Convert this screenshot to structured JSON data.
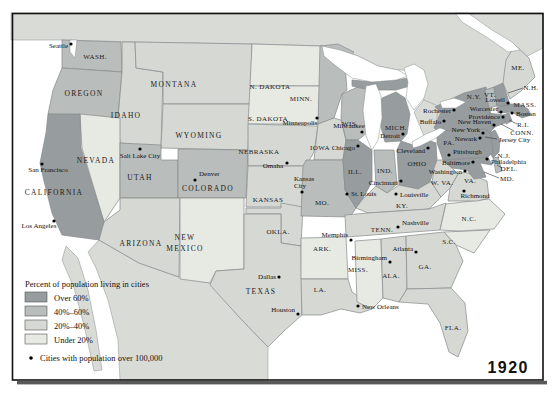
{
  "year_label": "1920",
  "legend": {
    "title": "Percent of population living in cities",
    "items": [
      {
        "label": "Over 60%",
        "category": "over60"
      },
      {
        "label": "40%–60%",
        "category": "c40_60"
      },
      {
        "label": "20%–40%",
        "category": "c20_40"
      },
      {
        "label": "Under 20%",
        "category": "under20"
      }
    ],
    "city_note": "Cities with population over 100,000",
    "category_colors": {
      "over60": "#979c9e",
      "c40_60": "#b9bdbb",
      "c20_40": "#d5d8d3",
      "under20": "#e7e9e3"
    }
  },
  "map": {
    "colors": {
      "outside": "#d9dbd7",
      "water": "#ffffff",
      "frame": "#111111",
      "shadow": "#595959"
    },
    "states": {
      "WA": {
        "label": "WASH.",
        "category": "c40_60"
      },
      "OR": {
        "label": "OREGON",
        "category": "c40_60"
      },
      "CA": {
        "label": "CALIFORNIA",
        "category": "over60"
      },
      "NV": {
        "label": "NEVADA",
        "category": "under20"
      },
      "ID": {
        "label": "IDAHO",
        "category": "c20_40"
      },
      "MT": {
        "label": "MONTANA",
        "category": "c20_40"
      },
      "WY": {
        "label": "WYOMING",
        "category": "c20_40"
      },
      "UT": {
        "label": "UTAH",
        "category": "c40_60"
      },
      "CO": {
        "label": "COLORADO",
        "category": "c40_60"
      },
      "AZ": {
        "label": "ARIZONA",
        "category": "c20_40"
      },
      "NM": {
        "label": "NEW MEXICO",
        "line1": "NEW",
        "line2": "MEXICO",
        "category": "under20"
      },
      "ND": {
        "label": "N. DAKOTA",
        "category": "under20"
      },
      "SD": {
        "label": "S. DAKOTA",
        "category": "under20"
      },
      "NE": {
        "label": "NEBRASKA",
        "category": "c20_40"
      },
      "KS": {
        "label": "KANSAS",
        "category": "c20_40"
      },
      "OK": {
        "label": "OKLA.",
        "category": "c20_40"
      },
      "TX": {
        "label": "TEXAS",
        "category": "c20_40"
      },
      "MN": {
        "label": "MINN.",
        "category": "c40_60"
      },
      "IA": {
        "label": "IOWA",
        "category": "c20_40"
      },
      "MO": {
        "label": "MO.",
        "category": "c40_60"
      },
      "AR": {
        "label": "ARK.",
        "category": "under20"
      },
      "LA": {
        "label": "LA.",
        "category": "c20_40"
      },
      "WI": {
        "label": "WIS.",
        "category": "c40_60"
      },
      "IL": {
        "label": "ILL.",
        "category": "over60"
      },
      "IN": {
        "label": "IND.",
        "category": "c40_60"
      },
      "MI": {
        "label": "MICH.",
        "category": "over60"
      },
      "OH": {
        "label": "OHIO",
        "category": "over60"
      },
      "KY": {
        "label": "KY.",
        "category": "c20_40"
      },
      "TN": {
        "label": "TENN.",
        "category": "c20_40"
      },
      "MS": {
        "label": "MISS.",
        "category": "under20"
      },
      "AL": {
        "label": "ALA.",
        "category": "c20_40"
      },
      "GA": {
        "label": "GA.",
        "category": "c20_40"
      },
      "FL": {
        "label": "FLA.",
        "category": "c20_40"
      },
      "SC": {
        "label": "S.C.",
        "category": "under20"
      },
      "NC": {
        "label": "N.C.",
        "category": "under20"
      },
      "VA": {
        "label": "VA.",
        "category": "c20_40"
      },
      "WV": {
        "label": "W. VA.",
        "category": "c20_40"
      },
      "MD": {
        "label": "MD.",
        "category": "over60"
      },
      "DE": {
        "label": "DEL.",
        "category": "c40_60"
      },
      "NJ": {
        "label": "N.J.",
        "category": "over60"
      },
      "PA": {
        "label": "PA.",
        "category": "over60"
      },
      "NY": {
        "label": "N.Y.",
        "category": "over60"
      },
      "CT": {
        "label": "CONN.",
        "category": "over60"
      },
      "RI": {
        "label": "R.I.",
        "category": "over60"
      },
      "MA": {
        "label": "MASS.",
        "category": "over60"
      },
      "VT": {
        "label": "VT.",
        "category": "c40_60"
      },
      "NH": {
        "label": "N.H.",
        "category": "over60"
      },
      "ME": {
        "label": "ME.",
        "category": "c20_40"
      }
    },
    "cities": {
      "seattle": {
        "name": "Seattle"
      },
      "san_francisco": {
        "name": "San Francisco"
      },
      "los_angeles": {
        "name": "Los Angeles"
      },
      "salt_lake_city": {
        "name": "Salt Lake City"
      },
      "denver": {
        "name": "Denver"
      },
      "omaha": {
        "name": "Omaha"
      },
      "kansas_city": {
        "name": "Kansas City",
        "line1": "Kansas",
        "line2": "City"
      },
      "minneapolis": {
        "name": "Minneapolis"
      },
      "milwaukee": {
        "name": "Milwaukee"
      },
      "chicago": {
        "name": "Chicago"
      },
      "st_louis": {
        "name": "St. Louis"
      },
      "memphis": {
        "name": "Memphis"
      },
      "dallas": {
        "name": "Dallas"
      },
      "houston": {
        "name": "Houston"
      },
      "new_orleans": {
        "name": "New Orleans"
      },
      "birmingham": {
        "name": "Birmingham"
      },
      "atlanta": {
        "name": "Atlanta"
      },
      "nashville": {
        "name": "Nashville"
      },
      "louisville": {
        "name": "Louisville"
      },
      "cincinnati": {
        "name": "Cincinnati"
      },
      "detroit": {
        "name": "Detroit"
      },
      "cleveland": {
        "name": "Cleveland"
      },
      "buffalo": {
        "name": "Buffalo"
      },
      "rochester": {
        "name": "Rochester"
      },
      "pittsburgh": {
        "name": "Pittsburgh"
      },
      "philadelphia": {
        "name": "Philadelphia"
      },
      "baltimore": {
        "name": "Baltimore"
      },
      "washington": {
        "name": "Washington"
      },
      "richmond": {
        "name": "Richmond"
      },
      "new_york": {
        "name": "New York"
      },
      "newark": {
        "name": "Newark"
      },
      "jersey_city": {
        "name": "Jersey City"
      },
      "new_haven": {
        "name": "New Haven"
      },
      "providence": {
        "name": "Providence"
      },
      "worcester": {
        "name": "Worcester"
      },
      "lowell": {
        "name": "Lowell"
      },
      "boston": {
        "name": "Boston"
      }
    }
  }
}
